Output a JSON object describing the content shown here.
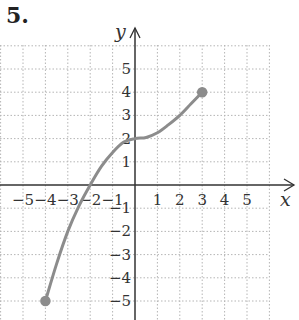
{
  "problem_number": "5.",
  "chart_data": {
    "type": "line",
    "title": "5.",
    "xlabel": "x",
    "ylabel": "y",
    "xlim": [
      -6,
      6
    ],
    "ylim": [
      -6,
      6
    ],
    "grid": true,
    "x_ticks": [
      -5,
      -4,
      -3,
      -2,
      -1,
      1,
      2,
      3,
      4,
      5
    ],
    "y_ticks": [
      5,
      4,
      3,
      2,
      1,
      -1,
      -2,
      -3,
      -4,
      -5
    ],
    "x_tick_labels": [
      "−5",
      "−4",
      "−3",
      "−2",
      "−1",
      "1",
      "2",
      "3",
      "4",
      "5"
    ],
    "y_tick_labels": [
      "5",
      "4",
      "3",
      "2",
      "1",
      "−1",
      "−2",
      "−3",
      "−4",
      "−5"
    ],
    "series": [
      {
        "name": "f(x)",
        "color": "#8c8c8c",
        "x": [
          -4,
          -3.5,
          -3,
          -2.5,
          -2,
          -1.5,
          -1,
          -0.5,
          0,
          0.5,
          1,
          1.5,
          2,
          2.5,
          3
        ],
        "y": [
          -5,
          -3.4,
          -2.0,
          -0.9,
          0.0,
          0.8,
          1.4,
          1.85,
          2.0,
          2.05,
          2.25,
          2.6,
          3.0,
          3.5,
          4.0
        ],
        "endpoints": [
          {
            "x": -4,
            "y": -5,
            "closed": true
          },
          {
            "x": 3,
            "y": 4,
            "closed": true
          }
        ]
      }
    ]
  }
}
